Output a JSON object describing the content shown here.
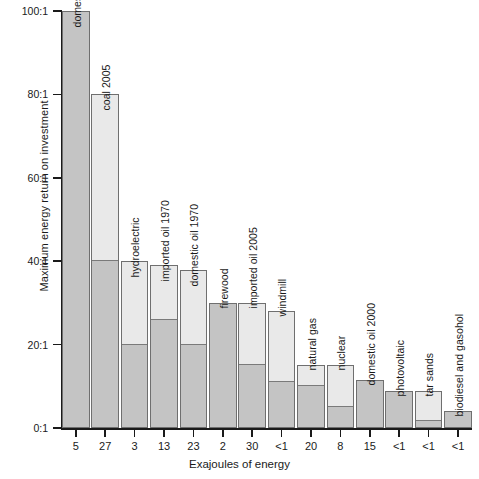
{
  "chart_data": {
    "type": "bar",
    "title": "",
    "xlabel": "Exajoules of energy",
    "ylabel": "Maximum energy return on investment",
    "ylim": [
      0,
      100
    ],
    "grid": false,
    "legend": "none",
    "ytick_labels": [
      "100:1",
      "80:1",
      "60:1",
      "40:1",
      "20:1",
      "0:1"
    ],
    "ytick_values": [
      100,
      80,
      60,
      40,
      20,
      0
    ],
    "categories": [
      "domestic oil 1930",
      "coal 2005",
      "hydroelectric",
      "imported oil 1970",
      "domestic oil 1970",
      "firewood",
      "imported oil 2005",
      "windmill",
      "natural gas",
      "nuclear",
      "domestic oil 2000",
      "photovoltaic",
      "tar sands",
      "biodiesel and gasohol"
    ],
    "xtick_labels": [
      "5",
      "27",
      "3",
      "13",
      "23",
      "2",
      "30",
      "<1",
      "20",
      "8",
      "15",
      "<1",
      "<1",
      "<1"
    ],
    "series": [
      {
        "name": "maximum EROI (bar top)",
        "values": [
          100,
          80,
          40,
          39,
          38,
          30,
          30,
          28,
          15,
          15,
          11.5,
          8.8,
          8.8,
          4
        ]
      },
      {
        "name": "typical / lower EROI (dark lower segment)",
        "values": [
          100,
          40,
          20,
          26,
          20,
          30,
          15,
          11,
          10,
          5,
          11.5,
          8.8,
          1.7,
          4
        ]
      }
    ]
  },
  "colors": {
    "bar_light": "#e9e9e9",
    "bar_dark": "#c4c4c4",
    "bar_border": "#6f6f6f",
    "split_line": "#7a7a7a",
    "axis": "#1a1a1a",
    "background": "#ffffff"
  }
}
